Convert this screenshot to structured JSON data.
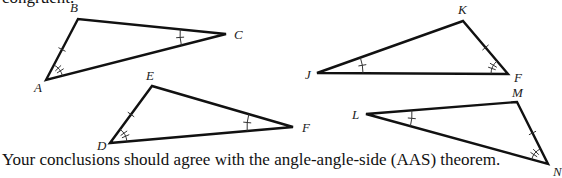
{
  "top_text_fragment": "congruent.",
  "caption": "Your conclusions should agree with the angle-angle-side (AAS) theorem.",
  "colors": {
    "line": "#111111",
    "mark": "#333333",
    "text": "#111111"
  },
  "triangles": [
    {
      "id": "ABC",
      "vertices": {
        "A": {
          "x": 46,
          "y": 80,
          "label": "A",
          "lx": 34,
          "ly": 92
        },
        "B": {
          "x": 78,
          "y": 19,
          "label": "B",
          "lx": 70,
          "ly": 12
        },
        "C": {
          "x": 226,
          "y": 34,
          "label": "C",
          "lx": 234,
          "ly": 39
        }
      },
      "angle_double": "A",
      "angle_single": "C",
      "side_tick": "AB"
    },
    {
      "id": "DEF",
      "vertices": {
        "D": {
          "x": 110,
          "y": 143,
          "label": "D",
          "lx": 97,
          "ly": 150
        },
        "E": {
          "x": 152,
          "y": 86,
          "label": "E",
          "lx": 146,
          "ly": 80
        },
        "F": {
          "x": 293,
          "y": 127,
          "label": "F",
          "lx": 302,
          "ly": 132
        }
      },
      "angle_double": "D",
      "angle_single": "F",
      "side_tick": "DE"
    },
    {
      "id": "JKF",
      "vertices": {
        "J": {
          "x": 317,
          "y": 73,
          "label": "J",
          "lx": 305,
          "ly": 79
        },
        "K": {
          "x": 463,
          "y": 21,
          "label": "K",
          "lx": 458,
          "ly": 14
        },
        "F": {
          "x": 508,
          "y": 74,
          "label": "F",
          "lx": 514,
          "ly": 82
        }
      },
      "angle_double": "F",
      "angle_single": "J",
      "side_tick": "KF"
    },
    {
      "id": "LMN",
      "vertices": {
        "L": {
          "x": 366,
          "y": 114,
          "label": "L",
          "lx": 352,
          "ly": 119
        },
        "M": {
          "x": 517,
          "y": 102,
          "label": "M",
          "lx": 512,
          "ly": 97
        },
        "N": {
          "x": 548,
          "y": 164,
          "label": "N",
          "lx": 553,
          "ly": 176
        }
      },
      "angle_double": "N",
      "angle_single": "L",
      "side_tick": "MN"
    }
  ]
}
